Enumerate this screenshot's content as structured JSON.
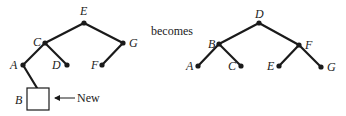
{
  "connector_text": "becomes",
  "before_tree": {
    "nodes": [
      {
        "id": "E",
        "label": "E"
      },
      {
        "id": "C",
        "label": "C"
      },
      {
        "id": "G",
        "label": "G"
      },
      {
        "id": "A",
        "label": "A"
      },
      {
        "id": "D",
        "label": "D"
      },
      {
        "id": "F",
        "label": "F"
      },
      {
        "id": "B",
        "label": "B"
      }
    ],
    "edges": [
      [
        "E",
        "C"
      ],
      [
        "E",
        "G"
      ],
      [
        "C",
        "A"
      ],
      [
        "C",
        "D"
      ],
      [
        "G",
        "F"
      ],
      [
        "A",
        "B"
      ]
    ],
    "new_node_annotation": "New"
  },
  "after_tree": {
    "nodes": [
      {
        "id": "D",
        "label": "D"
      },
      {
        "id": "B",
        "label": "B"
      },
      {
        "id": "F",
        "label": "F"
      },
      {
        "id": "A",
        "label": "A"
      },
      {
        "id": "C",
        "label": "C"
      },
      {
        "id": "E",
        "label": "E"
      },
      {
        "id": "G",
        "label": "G"
      }
    ],
    "edges": [
      [
        "D",
        "B"
      ],
      [
        "D",
        "F"
      ],
      [
        "B",
        "A"
      ],
      [
        "B",
        "C"
      ],
      [
        "F",
        "E"
      ],
      [
        "F",
        "G"
      ]
    ]
  }
}
